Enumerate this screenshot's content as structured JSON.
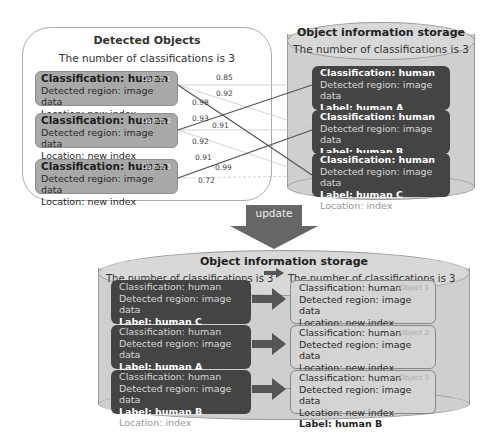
{
  "detected_panel": {
    "title": "Detected Objects",
    "subtitle": "The number of classifications is 3",
    "objects": [
      {
        "classification": "Classification: human",
        "region": "Detected region: image data",
        "location": "Location:  new index",
        "tag": "Object 1"
      },
      {
        "classification": "Classification: human",
        "region": "Detected region: image data",
        "location": "Location: new index",
        "tag": "Object 2"
      },
      {
        "classification": "Classification: human",
        "region": "Detected region: image data",
        "location": "Location: new index",
        "tag": "Object 3"
      }
    ],
    "scores": [
      "0.85",
      "0.92",
      "0.98",
      "0.93",
      "0.91",
      "0.92",
      "0.91",
      "0.99",
      "0.72"
    ]
  },
  "storage_top": {
    "title": "Object information storage",
    "subtitle": "The number of classifications is 3",
    "records": [
      {
        "classification": "Classification: human",
        "region": "Detected region: image data",
        "label": "Label: human A",
        "location": "Location: index"
      },
      {
        "classification": "Classification: human",
        "region": "Detected region: image data",
        "label": "Label: human B",
        "location": "Location: index"
      },
      {
        "classification": "Classification: human",
        "region": "Detected region: image data",
        "label": "Label: human C",
        "location": "Location: index"
      }
    ]
  },
  "update_arrow": {
    "label": "update"
  },
  "storage_bottom": {
    "title": "Object information storage",
    "left_subtitle": "The number of classifications is 3",
    "right_subtitle": "The number of classifications is 3",
    "old_records": [
      {
        "classification": "Classification: human",
        "region": "Detected region: image data",
        "label": "Label: human C",
        "location": "Location: index"
      },
      {
        "classification": "Classification: human",
        "region": "Detected region: image data",
        "label": "Label: human A",
        "location": "Location: index"
      },
      {
        "classification": "Classification: human",
        "region": "Detected region: image data",
        "label": "Label: human B",
        "location": "Location: index"
      }
    ],
    "new_records": [
      {
        "classification": "Classification: human",
        "region": "Detected region: image data",
        "location": "Location:  new index",
        "label": "Label: human C",
        "tag": "Object 1"
      },
      {
        "classification": "Classification: human",
        "region": "Detected region: image data",
        "location": "Location:  new index",
        "label": "Label: human A",
        "tag": "Object 2"
      },
      {
        "classification": "Classification: human",
        "region": "Detected region: image data",
        "location": "Location:  new index",
        "label": "Label: human B",
        "tag": "Object 3"
      }
    ]
  }
}
